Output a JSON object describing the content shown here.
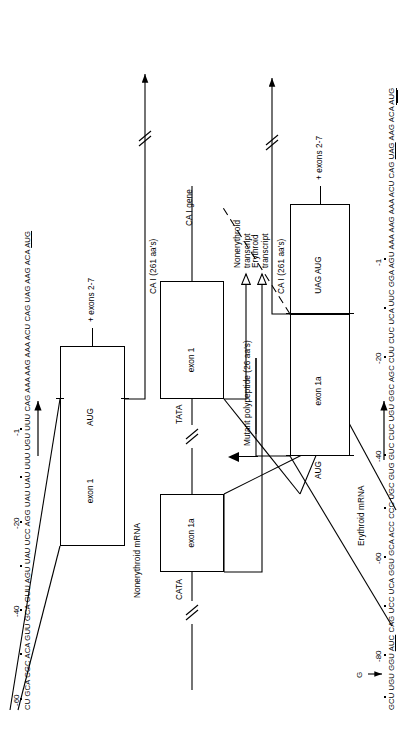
{
  "figure": {
    "ink_color": "#000000",
    "paper_color": "#ffffff"
  },
  "panels": {
    "nonerythroid_mrna": {
      "label": "Nonerythroid mRNA",
      "exon_label": "exon 1",
      "start_codon": "AUG",
      "downstream_label": "+ exons 2-7",
      "product_label": "CA I (261 aa's)",
      "sequence": "CU GCA CGC ACA GUU GCA GUU AGU UAU UCC AGG UAU UAU UUU UGU UUU CAG AAA AAG AAA ACU CAG UAG AAG ACA AUG",
      "sequence_plain": "CU GCA CGC ACA GUU GCA GUU AGU UAU UCC AGG UAU UAU UUU UGU UUU CAG AAA AAG AAA ACU CAG UAG AAG ACA ",
      "sequence_underlined": "AUG",
      "position_markers": [
        "-60",
        "-40",
        "-20",
        "-1"
      ]
    },
    "gene": {
      "label": "CA I gene",
      "exon1_label": "exon 1",
      "exon1a_label": "exon 1a",
      "promoter_proximal": "TATA",
      "promoter_distal": "CATA",
      "nonerythroid_transcript_label": "Nonerythroid\ntranscript",
      "nonerythroid_transcript_line1": "Nonerythroid",
      "nonerythroid_transcript_line2": "transcript",
      "erythroid_transcript_line1": "Erythroid",
      "erythroid_transcript_line2": "transcript"
    },
    "erythroid_mrna": {
      "label": "Erythroid mRNA",
      "exon1a_label": "exon 1a",
      "upstream_start_codon": "AUG",
      "stop_and_start": "UAG AUG",
      "downstream_label": "+ exons 2-7",
      "product_label": "CA I (261 aa's)",
      "mutant_product_label": "Mutant polypeptide (26 aa's)",
      "sequence_prefix": "GCU UGU GGU ",
      "sequence_mutation": "AUC",
      "sequence_mid": " CAG UCC UCA GGU GCA ACC CCC UGC GUG GUC CUC UGU GGC AGC CUU CUC UCA UUC GGA AGU AAA AAG AAA ACU CAG ",
      "sequence_stop": "UAG",
      "sequence_post_stop": " AAG ACA ",
      "sequence_start": "AUG",
      "sequence_full": "GCU UGU GGU AUC CAG UCC UCA GGU GCA ACC CCC UGC GUG GUC CUC UGU GGC AGC CUU CUC UCA UUC GGA AGU AAA AAG AAA ACU CAG UAG AAG ACA AUG",
      "mutation_base": "G",
      "position_markers": [
        "-80",
        "-60",
        "-40",
        "-20",
        "-1"
      ]
    }
  }
}
